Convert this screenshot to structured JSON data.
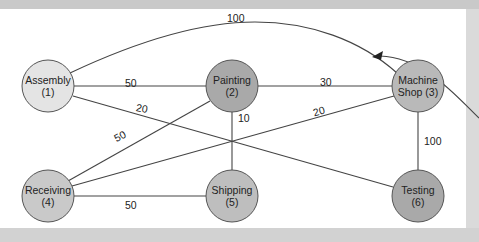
{
  "diagram": {
    "nodes": [
      {
        "id": 1,
        "name": "Assembly",
        "line1": "Assembly",
        "line2": "(1)",
        "cx": 48,
        "cy": 86,
        "fill": "#e4e4e4"
      },
      {
        "id": 2,
        "name": "Painting",
        "line1": "Painting",
        "line2": "(2)",
        "cx": 232,
        "cy": 86,
        "fill": "#a9a9a9"
      },
      {
        "id": 3,
        "name": "Machine Shop",
        "line1": "Machine",
        "line2": "Shop (3)",
        "cx": 418,
        "cy": 86,
        "fill": "#b9b9b9"
      },
      {
        "id": 4,
        "name": "Receiving",
        "line1": "Receiving",
        "line2": "(4)",
        "cx": 48,
        "cy": 196,
        "fill": "#c9c9c9"
      },
      {
        "id": 5,
        "name": "Shipping",
        "line1": "Shipping",
        "line2": "(5)",
        "cx": 232,
        "cy": 196,
        "fill": "#bebebe"
      },
      {
        "id": 6,
        "name": "Testing",
        "line1": "Testing",
        "line2": "(6)",
        "cx": 418,
        "cy": 196,
        "fill": "#a9a9a9"
      }
    ],
    "edges": [
      {
        "from": 1,
        "to": 3,
        "weight": "100",
        "curved": true
      },
      {
        "from": 1,
        "to": 2,
        "weight": "50"
      },
      {
        "from": 1,
        "to": 6,
        "weight": "20"
      },
      {
        "from": 2,
        "to": 3,
        "weight": "30"
      },
      {
        "from": 2,
        "to": 4,
        "weight": "50"
      },
      {
        "from": 2,
        "to": 5,
        "weight": "10"
      },
      {
        "from": 3,
        "to": 4,
        "weight": "20"
      },
      {
        "from": 3,
        "to": 6,
        "weight": "100"
      },
      {
        "from": 4,
        "to": 5,
        "weight": "50"
      }
    ],
    "edge_labels": {
      "e13": "100",
      "e12": "50",
      "e16": "20",
      "e23": "30",
      "e24": "50",
      "e25": "10",
      "e34": "20",
      "e36": "100",
      "e45": "50"
    },
    "node_text": {
      "n1a": "Assembly",
      "n1b": "(1)",
      "n2a": "Painting",
      "n2b": "(2)",
      "n3a": "Machine",
      "n3b": "Shop (3)",
      "n4a": "Receiving",
      "n4b": "(4)",
      "n5a": "Shipping",
      "n5b": "(5)",
      "n6a": "Testing",
      "n6b": "(6)"
    },
    "colors": {
      "line": "#444444",
      "node_stroke": "#555555",
      "panel": "#ffffff"
    }
  }
}
